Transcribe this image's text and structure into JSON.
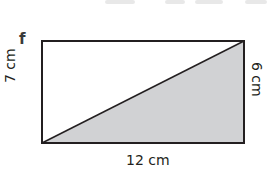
{
  "diagram": {
    "part_label": "f",
    "labels": {
      "left_height": "7 cm",
      "right_height": "6 cm",
      "base": "12 cm"
    },
    "colors": {
      "stroke": "#231f20",
      "shaded_fill": "#d1d2d4",
      "background": "#ffffff"
    }
  }
}
